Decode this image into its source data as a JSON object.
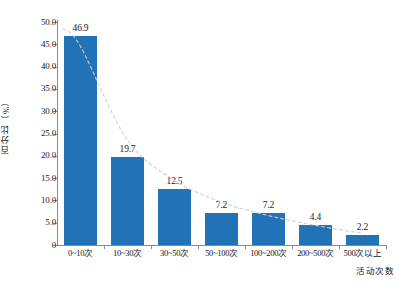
{
  "chart_data": {
    "type": "bar",
    "title": "",
    "xlabel": "活动次数",
    "ylabel": "百分比（%）",
    "categories": [
      "0~10次",
      "10~30次",
      "30~50次",
      "50~100次",
      "100~200次",
      "200~500次",
      "500次以上"
    ],
    "values": [
      46.9,
      19.7,
      12.5,
      7.2,
      7.2,
      4.4,
      2.2
    ],
    "value_labels": [
      "46.9",
      "19.7",
      "12.5",
      "7.2",
      "7.2",
      "4.4",
      "2.2"
    ],
    "ylim": [
      0,
      50
    ],
    "ytick_values": [
      0,
      5,
      10,
      15,
      20,
      25,
      30,
      35,
      40,
      45,
      50
    ],
    "ytick_labels": [
      "0",
      "5.0",
      "10.0",
      "15.0",
      "20.0",
      "25.0",
      "30.0",
      "35.0",
      "40.0",
      "45.0",
      "50.0"
    ],
    "grid": false,
    "legend": "none",
    "series": [
      {
        "name": "百分比",
        "kind": "bar",
        "color": "#2272b8",
        "values": [
          46.9,
          19.7,
          12.5,
          7.2,
          7.2,
          4.4,
          2.2
        ]
      },
      {
        "name": "趋势线",
        "kind": "trendline",
        "style": "dashed",
        "color": "#cfcfcf",
        "values": [
          44.5,
          23.5,
          14.5,
          9.6,
          6.6,
          4.4,
          2.6
        ]
      }
    ],
    "colors": {
      "bar": "#2272b8",
      "trendline": "#cfcfcf",
      "axis": "#8a8a8a",
      "text": "#1a1a1a",
      "background": "#ffffff"
    }
  },
  "caption": {
    "ghost_text": ""
  }
}
